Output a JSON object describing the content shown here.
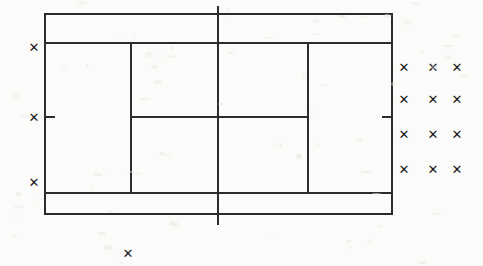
{
  "diagram": {
    "background_color": "#fbfbf9",
    "line_color": "#2b2b2b",
    "mark_color": "#1b1b1b",
    "mark_glyph": "✕",
    "canvas": {
      "width": 483,
      "height": 266
    }
  },
  "court": {
    "doubles_boundary": {
      "x1": 45,
      "y1": 14,
      "x2": 392,
      "y2": 214
    },
    "singles_sideline_top_y": 43,
    "singles_sideline_bottom_y": 193,
    "service_line_left_x": 131,
    "service_line_right_x": 308,
    "center_service_line_y": 117,
    "net_line_x": 218,
    "net_line_y1": 7,
    "net_line_y2": 224,
    "center_mark_left_x": 45,
    "center_mark_right_x": 392,
    "center_mark_y": 117,
    "center_mark_length": 9,
    "line_width": 2
  },
  "marks": {
    "left_column": [
      {
        "id": "left-mark-1",
        "x": 34,
        "y": 47,
        "label": "✕"
      },
      {
        "id": "left-mark-2",
        "x": 34,
        "y": 117,
        "label": "✕"
      },
      {
        "id": "left-mark-3",
        "x": 34,
        "y": 182,
        "label": "✕"
      }
    ],
    "bottom": [
      {
        "id": "bottom-mark-1",
        "x": 128,
        "y": 253,
        "label": "✕"
      }
    ],
    "right_cluster": [
      {
        "id": "right-mark-r1c1",
        "x": 404,
        "y": 67,
        "label": "✕"
      },
      {
        "id": "right-mark-r1c2",
        "x": 433,
        "y": 67,
        "label": "✕"
      },
      {
        "id": "right-mark-r1c3",
        "x": 457,
        "y": 67,
        "label": "✕"
      },
      {
        "id": "right-mark-r2c1",
        "x": 404,
        "y": 99,
        "label": "✕"
      },
      {
        "id": "right-mark-r2c2",
        "x": 433,
        "y": 99,
        "label": "✕"
      },
      {
        "id": "right-mark-r2c3",
        "x": 457,
        "y": 99,
        "label": "✕"
      },
      {
        "id": "right-mark-r3c1",
        "x": 404,
        "y": 134,
        "label": "✕"
      },
      {
        "id": "right-mark-r3c2",
        "x": 433,
        "y": 134,
        "label": "✕"
      },
      {
        "id": "right-mark-r3c3",
        "x": 457,
        "y": 134,
        "label": "✕"
      },
      {
        "id": "right-mark-r4c1",
        "x": 404,
        "y": 169,
        "label": "✕"
      },
      {
        "id": "right-mark-r4c2",
        "x": 433,
        "y": 169,
        "label": "✕"
      },
      {
        "id": "right-mark-r4c3",
        "x": 457,
        "y": 169,
        "label": "✕"
      }
    ]
  },
  "chart_data": {
    "type": "scatter",
    "xlabel": "",
    "ylabel": "",
    "xlim": [
      0,
      483
    ],
    "ylim": [
      266,
      0
    ],
    "grid": false,
    "legend": null,
    "series": [
      {
        "name": "left-sideline marks",
        "x": [
          34,
          34,
          34
        ],
        "y": [
          47,
          117,
          182
        ]
      },
      {
        "name": "bottom mark",
        "x": [
          128
        ],
        "y": [
          253
        ]
      },
      {
        "name": "right cluster marks",
        "x": [
          404,
          433,
          457,
          404,
          433,
          457,
          404,
          433,
          457,
          404,
          433,
          457
        ],
        "y": [
          67,
          67,
          67,
          99,
          99,
          99,
          134,
          134,
          134,
          169,
          169,
          169
        ]
      }
    ],
    "annotations": [
      "doubles boundary rectangle 45,14 to 392,214",
      "singles sidelines at y=43 and y=193",
      "service lines at x=131 and x=308",
      "center service line at y=117 from x=131 to x=308",
      "net line vertical at x=218 from y=7 to y=224",
      "center marks at x=45 and x=392 at y=117"
    ]
  }
}
